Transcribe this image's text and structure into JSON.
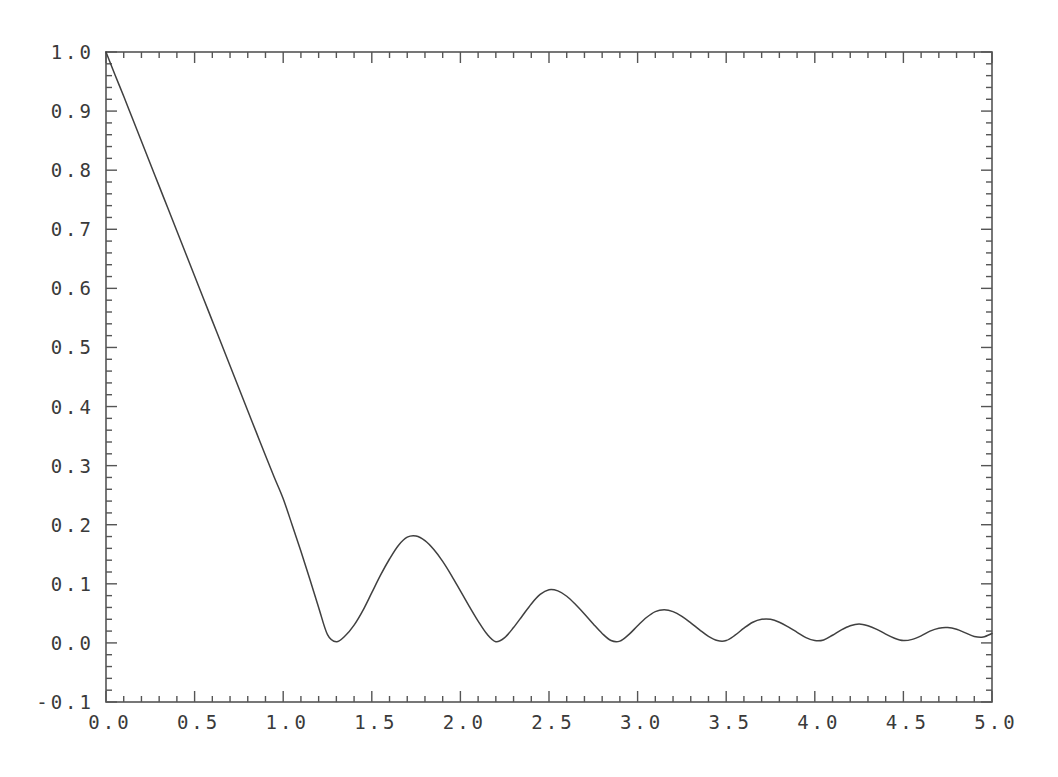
{
  "figure": {
    "background_color": "#ffffff",
    "line_color": "#404040",
    "axis_color": "#555555",
    "title": "",
    "width": 1058,
    "height": 777
  },
  "axes": {
    "frame": {
      "left": 106,
      "top": 52,
      "right": 992,
      "bottom": 702
    },
    "y_ticks": [
      "1.0",
      "0.9",
      "0.8",
      "0.7",
      "0.6",
      "0.5",
      "0.4",
      "0.3",
      "0.2",
      "0.1",
      "0.0",
      "-0.1"
    ],
    "x_ticks": [
      "0.0",
      "0.5",
      "1.0",
      "1.5",
      "2.0",
      "2.5",
      "3.0",
      "3.5",
      "4.0",
      "4.5",
      "5.0"
    ],
    "xlabel": "",
    "ylabel": ""
  },
  "chart_data": {
    "type": "line",
    "title": "",
    "xlabel": "",
    "ylabel": "",
    "xlim": [
      0.0,
      5.0
    ],
    "ylim": [
      -0.1,
      1.0
    ],
    "grid": false,
    "legend": null,
    "xticks": [
      0.0,
      0.5,
      1.0,
      1.5,
      2.0,
      2.5,
      3.0,
      3.5,
      4.0,
      4.5,
      5.0
    ],
    "yticks": [
      -0.1,
      0.0,
      0.1,
      0.2,
      0.3,
      0.4,
      0.5,
      0.6,
      0.7,
      0.8,
      0.9,
      1.0
    ],
    "minor_ticks": true,
    "series": [
      {
        "name": "damped oscillation",
        "x": [
          0.0,
          0.05,
          0.1,
          0.15,
          0.2,
          0.25,
          0.3,
          0.35,
          0.4,
          0.45,
          0.5,
          0.55,
          0.6,
          0.65,
          0.7,
          0.75,
          0.8,
          0.85,
          0.9,
          0.95,
          1.0,
          1.05,
          1.1,
          1.15,
          1.2,
          1.25,
          1.3,
          1.35,
          1.4,
          1.45,
          1.5,
          1.55,
          1.6,
          1.65,
          1.7,
          1.75,
          1.8,
          1.85,
          1.9,
          1.95,
          2.0,
          2.05,
          2.1,
          2.15,
          2.2,
          2.25,
          2.3,
          2.35,
          2.4,
          2.45,
          2.5,
          2.55,
          2.6,
          2.65,
          2.7,
          2.75,
          2.8,
          2.85,
          2.9,
          2.95,
          3.0,
          3.05,
          3.1,
          3.15,
          3.2,
          3.25,
          3.3,
          3.35,
          3.4,
          3.45,
          3.5,
          3.55,
          3.6,
          3.65,
          3.7,
          3.75,
          3.8,
          3.85,
          3.9,
          3.95,
          4.0,
          4.05,
          4.1,
          4.15,
          4.2,
          4.25,
          4.3,
          4.35,
          4.4,
          4.45,
          4.5,
          4.55,
          4.6,
          4.65,
          4.7,
          4.75,
          4.8,
          4.85,
          4.9,
          4.95,
          5.0
        ],
        "y": [
          1.0,
          0.962,
          0.925,
          0.887,
          0.849,
          0.811,
          0.773,
          0.735,
          0.697,
          0.659,
          0.621,
          0.583,
          0.545,
          0.507,
          0.469,
          0.431,
          0.393,
          0.355,
          0.317,
          0.28,
          0.244,
          0.2,
          0.155,
          0.108,
          0.06,
          0.014,
          0.002,
          0.012,
          0.03,
          0.055,
          0.085,
          0.115,
          0.142,
          0.165,
          0.179,
          0.181,
          0.173,
          0.158,
          0.138,
          0.114,
          0.088,
          0.062,
          0.037,
          0.015,
          0.002,
          0.009,
          0.026,
          0.046,
          0.066,
          0.082,
          0.09,
          0.088,
          0.079,
          0.065,
          0.049,
          0.032,
          0.016,
          0.004,
          0.003,
          0.014,
          0.029,
          0.043,
          0.053,
          0.056,
          0.053,
          0.045,
          0.034,
          0.022,
          0.011,
          0.004,
          0.004,
          0.013,
          0.025,
          0.035,
          0.04,
          0.04,
          0.035,
          0.027,
          0.018,
          0.009,
          0.004,
          0.005,
          0.013,
          0.022,
          0.029,
          0.032,
          0.029,
          0.023,
          0.015,
          0.008,
          0.004,
          0.006,
          0.012,
          0.02,
          0.025,
          0.026,
          0.023,
          0.017,
          0.011,
          0.01,
          0.016
        ]
      }
    ]
  }
}
